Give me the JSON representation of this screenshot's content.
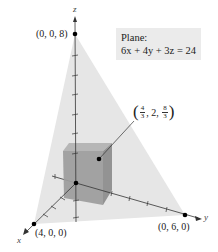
{
  "diagram": {
    "axes": {
      "x_label": "x",
      "y_label": "y",
      "z_label": "z"
    },
    "points": {
      "z_intercept": "(0, 0, 8)",
      "x_intercept": "(4, 0, 0)",
      "y_intercept": "(0, 6, 0)",
      "box_vertex": {
        "open": "(",
        "x_num": "4",
        "x_den": "3",
        "sep1": ", 2, ",
        "z_num": "8",
        "z_den": "3",
        "close": ")"
      }
    },
    "plane_label": {
      "title": "Plane:",
      "equation": "6x + 4y + 3z = 24"
    },
    "colors": {
      "plane_fill": "#e6e6e6",
      "box_front": "#9a9a9a",
      "box_top": "#b0b0b0",
      "box_side": "#8a8a8a",
      "axis": "#333333",
      "label_box": "#ebebeb"
    }
  }
}
